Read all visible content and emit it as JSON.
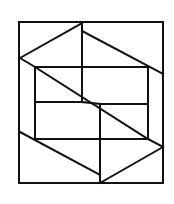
{
  "diagram": {
    "type": "line-figure",
    "stroke_color": "#111111",
    "background": "#ffffff",
    "outer_frame": {
      "x1": 19,
      "y1": 22,
      "x2": 163,
      "y2": 183
    },
    "inner_rect": {
      "x1": 35,
      "y1": 67,
      "x2": 148,
      "y2": 139
    },
    "segments": [
      {
        "id": "top-left-slant",
        "x1": 20,
        "y1": 58,
        "x2": 82,
        "y2": 23
      },
      {
        "id": "left-lower-slant-top",
        "x1": 20,
        "y1": 58,
        "x2": 35,
        "y2": 67
      },
      {
        "id": "center-vertical-upper",
        "x1": 82,
        "y1": 23,
        "x2": 82,
        "y2": 102
      },
      {
        "id": "top-right-slant",
        "x1": 82,
        "y1": 31,
        "x2": 163,
        "y2": 74
      },
      {
        "id": "main-diagonal",
        "x1": 35,
        "y1": 67,
        "x2": 148,
        "y2": 139
      },
      {
        "id": "middle-left-horizontal",
        "x1": 35,
        "y1": 102,
        "x2": 82,
        "y2": 102
      },
      {
        "id": "middle-step-slant",
        "x1": 82,
        "y1": 102,
        "x2": 100,
        "y2": 104
      },
      {
        "id": "middle-right-horizontal",
        "x1": 100,
        "y1": 104,
        "x2": 148,
        "y2": 104
      },
      {
        "id": "center-vertical-lower",
        "x1": 100,
        "y1": 104,
        "x2": 100,
        "y2": 183
      },
      {
        "id": "bottom-left-slant",
        "x1": 20,
        "y1": 132,
        "x2": 100,
        "y2": 175
      },
      {
        "id": "bottom-right-slant",
        "x1": 100,
        "y1": 183,
        "x2": 163,
        "y2": 147
      },
      {
        "id": "right-lower-short-slant",
        "x1": 148,
        "y1": 139,
        "x2": 163,
        "y2": 147
      }
    ]
  }
}
